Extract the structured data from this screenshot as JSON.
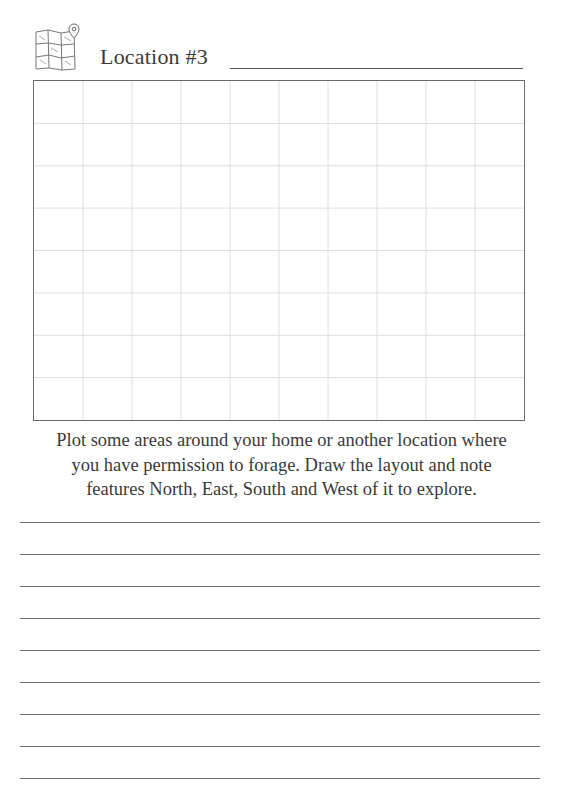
{
  "header": {
    "icon": "folded-map-with-pin-icon",
    "title": "Location #3"
  },
  "grid": {
    "columns": 10,
    "rows": 8,
    "border_color": "#6a6a6a",
    "line_color": "#dcdcdc"
  },
  "instructions": {
    "line1": "Plot some areas around your home or another location where",
    "line2": "you have permission to forage. Draw the layout and note",
    "line3": "features North, East, South and West of it to explore."
  },
  "writing_lines": {
    "count": 9,
    "tops": [
      522,
      554,
      586,
      618,
      650,
      682,
      714,
      746,
      778
    ]
  }
}
